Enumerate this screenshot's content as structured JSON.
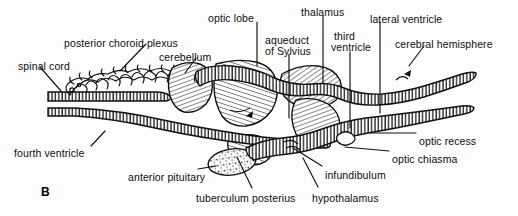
{
  "figure": {
    "panel_label": "B",
    "panel_label_x": 41,
    "panel_label_y": 185,
    "background_color": "#fdfdfd",
    "ink_color": "#111111"
  },
  "labels": [
    {
      "id": "spinal-cord",
      "text": "spinal cord",
      "x": 18,
      "y": 61,
      "align": "left"
    },
    {
      "id": "posterior-choroid-plexus",
      "text": "posterior choroid plexus",
      "x": 64,
      "y": 38,
      "align": "left"
    },
    {
      "id": "cerebellum",
      "text": "cerebellum",
      "x": 159,
      "y": 52,
      "align": "left"
    },
    {
      "id": "optic-lobe",
      "text": "optic lobe",
      "x": 208,
      "y": 13,
      "align": "left"
    },
    {
      "id": "aqueduct-of-sylvius-1",
      "text": "aqueduct",
      "x": 265,
      "y": 35,
      "align": "left"
    },
    {
      "id": "aqueduct-of-sylvius-2",
      "text": "of Sylvius",
      "x": 265,
      "y": 46,
      "align": "left"
    },
    {
      "id": "thalamus",
      "text": "thalamus",
      "x": 301,
      "y": 7,
      "align": "left"
    },
    {
      "id": "third-ventricle-1",
      "text": "third",
      "x": 334,
      "y": 31,
      "align": "left"
    },
    {
      "id": "third-ventricle-2",
      "text": "ventricle",
      "x": 331,
      "y": 42,
      "align": "left"
    },
    {
      "id": "lateral-ventricle",
      "text": "lateral ventricle",
      "x": 370,
      "y": 14,
      "align": "left"
    },
    {
      "id": "cerebral-hemisphere",
      "text": "cerebral hemisphere",
      "x": 395,
      "y": 39,
      "align": "left"
    },
    {
      "id": "optic-recess",
      "text": "optic recess",
      "x": 419,
      "y": 136,
      "align": "left"
    },
    {
      "id": "optic-chiasma",
      "text": "optic chiasma",
      "x": 392,
      "y": 154,
      "align": "left"
    },
    {
      "id": "infundibulum",
      "text": "infundibulum",
      "x": 325,
      "y": 170,
      "align": "left"
    },
    {
      "id": "hypothalamus",
      "text": "hypothalamus",
      "x": 312,
      "y": 193,
      "align": "left"
    },
    {
      "id": "tuberculum-posterius",
      "text": "tuberculum posterius",
      "x": 196,
      "y": 193,
      "align": "left"
    },
    {
      "id": "anterior-pituitary",
      "text": "anterior pituitary",
      "x": 128,
      "y": 172,
      "align": "left"
    },
    {
      "id": "fourth-ventricle",
      "text": "fourth ventricle",
      "x": 14,
      "y": 148,
      "align": "left"
    }
  ],
  "leaders": [
    {
      "id": "leader-spinal-cord",
      "d": "M40,67 L61,91"
    },
    {
      "id": "leader-posterior-choroid-plexus",
      "d": "M146,44 L120,71"
    },
    {
      "id": "leader-cerebellum",
      "d": "M196,58 L185,73"
    },
    {
      "id": "leader-optic-lobe",
      "d": "M257,22 L257,66"
    },
    {
      "id": "leader-aqueduct-of-sylvius",
      "d": "M289,54 L289,118"
    },
    {
      "id": "leader-thalamus",
      "d": "M323,16 L323,83"
    },
    {
      "id": "leader-third-ventricle",
      "d": "M350,52 L350,128"
    },
    {
      "id": "leader-lateral-ventricle",
      "d": "M380,22 L380,113"
    },
    {
      "id": "leader-cerebral-hemisphere",
      "d": "M424,46 L409,66"
    },
    {
      "id": "leader-optic-recess",
      "d": "M416,133 L370,133"
    },
    {
      "id": "leader-optic-chiasma",
      "d": "M389,151 L345,147"
    },
    {
      "id": "leader-infundibulum",
      "d": "M322,166 L293,148"
    },
    {
      "id": "leader-hypothalamus",
      "d": "M318,187 L303,158"
    },
    {
      "id": "leader-tuberculum-posterius",
      "d": "M252,188 L237,157"
    },
    {
      "id": "leader-anterior-pituitary",
      "d": "M198,169 L216,166"
    },
    {
      "id": "leader-fourth-ventricle",
      "d": "M91,146 L105,131"
    }
  ]
}
